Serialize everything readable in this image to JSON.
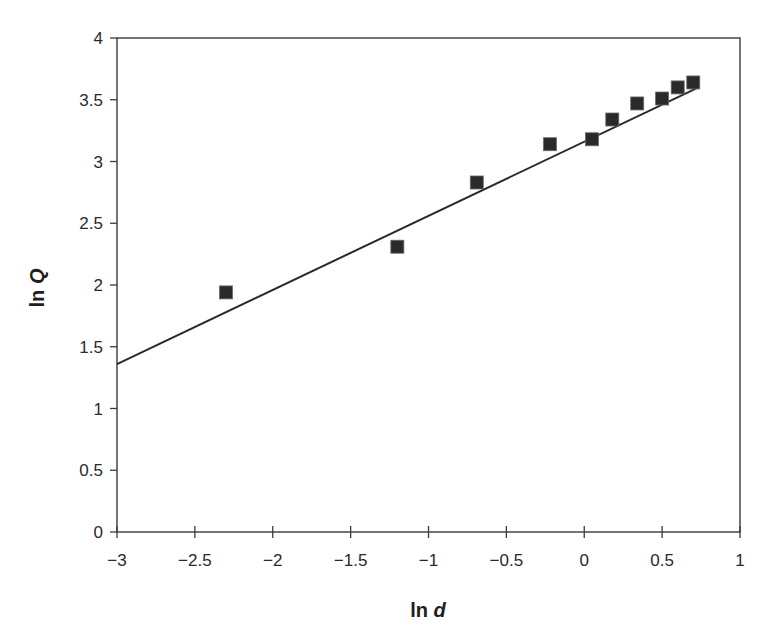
{
  "chart_data": {
    "type": "scatter",
    "title": "",
    "xlabel": "ln d",
    "ylabel": "ln Q",
    "xlim": [
      -3,
      1
    ],
    "ylim": [
      0,
      4
    ],
    "x_ticks": [
      -3,
      -2.5,
      -2,
      -1.5,
      -1,
      -0.5,
      0,
      0.5,
      1
    ],
    "x_tick_labels": [
      "−3",
      "−2.5",
      "−2",
      "−1.5",
      "−1",
      "−0.5",
      "0",
      "0.5",
      "1"
    ],
    "y_ticks": [
      0,
      0.5,
      1,
      1.5,
      2,
      2.5,
      3,
      3.5,
      4
    ],
    "y_tick_labels": [
      "0",
      "0.5",
      "1",
      "1.5",
      "2",
      "2.5",
      "3",
      "3.5",
      "4"
    ],
    "grid": false,
    "legend": null,
    "series": [
      {
        "name": "observed",
        "marker": "square",
        "color": "#2a2a2a",
        "x": [
          -2.3,
          -1.2,
          -0.69,
          -0.22,
          0.05,
          0.18,
          0.34,
          0.5,
          0.6,
          0.7
        ],
        "y": [
          1.94,
          2.31,
          2.83,
          3.14,
          3.18,
          3.34,
          3.47,
          3.51,
          3.6,
          3.64
        ]
      }
    ],
    "trendline": {
      "type": "linear",
      "slope": 0.6,
      "intercept": 3.16,
      "x_start": -3,
      "x_end": 0.72,
      "color": "#2a2a2a"
    }
  },
  "labels": {
    "x_axis_main": "ln ",
    "x_axis_var": "d",
    "y_axis_main": "ln ",
    "y_axis_var": "Q"
  },
  "colors": {
    "axis": "#3a3a3a",
    "marker": "#2a2a2a",
    "line": "#2a2a2a",
    "background": "#ffffff"
  }
}
